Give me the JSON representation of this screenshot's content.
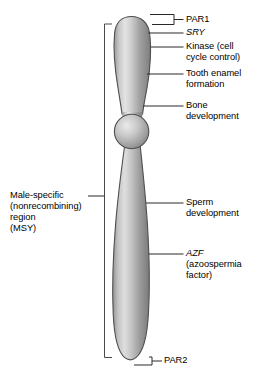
{
  "figure": {
    "background_color": "#ffffff",
    "chromosome": {
      "name": "Y chromosome",
      "outline_color": "#4a4a4a",
      "fill_light": "#e8e8e8",
      "fill_mid": "#b4b4b4",
      "fill_dark": "#7b7b7b",
      "parts": [
        {
          "name": "short-arm",
          "label": "Yp short arm"
        },
        {
          "name": "centromere",
          "label": "centromere"
        },
        {
          "name": "long-arm",
          "label": "Yq long arm"
        }
      ]
    },
    "leader_color": "#1a1a1a",
    "bracket_color": "#5a5a5a"
  },
  "labels": {
    "par1": "PAR1",
    "sry": "SRY",
    "kinase_line1": "Kinase (cell",
    "kinase_line2": "cycle control)",
    "tooth_line1": "Tooth enamel",
    "tooth_line2": "formation",
    "bone_line1": "Bone",
    "bone_line2": "development",
    "sperm_line1": "Sperm",
    "sperm_line2": "development",
    "azf": "AZF",
    "azf_line1": "(azoospermia",
    "azf_line2": "factor)",
    "par2": "PAR2",
    "msy_line1": "Male-specific",
    "msy_line2": "(nonrecombining)",
    "msy_line3": "region",
    "msy_line4": "(MSY)"
  }
}
